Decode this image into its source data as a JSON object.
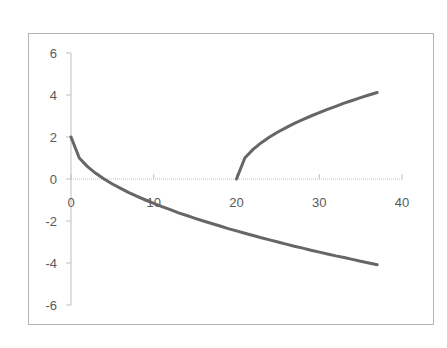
{
  "chart_data": {
    "type": "line",
    "title": "",
    "xlabel": "",
    "ylabel": "",
    "xlim": [
      0,
      40
    ],
    "ylim": [
      -6,
      6
    ],
    "x_ticks": [
      "0",
      "10",
      "20",
      "30",
      "40"
    ],
    "y_ticks": [
      "6",
      "4",
      "2",
      "0",
      "-2",
      "-4",
      "-6"
    ],
    "grid": false,
    "legend": null,
    "line_color": "#666666",
    "series": [
      {
        "name": "Series 1",
        "x": [
          0,
          1,
          2,
          3,
          4,
          5,
          6,
          7,
          8,
          9,
          10,
          11,
          12,
          13,
          14,
          15,
          16,
          17,
          18,
          19,
          20,
          21,
          22,
          23,
          24,
          25,
          26,
          27,
          28,
          29,
          30,
          31,
          32,
          33,
          34,
          35,
          36,
          37
        ],
        "values": [
          2.0,
          1.0,
          0.59,
          0.27,
          0.0,
          -0.24,
          -0.45,
          -0.65,
          -0.83,
          -1.0,
          -1.16,
          -1.32,
          -1.46,
          -1.61,
          -1.74,
          -1.87,
          -2.0,
          -2.12,
          -2.24,
          -2.36,
          -2.47,
          -2.58,
          -2.69,
          -2.8,
          -2.9,
          -3.0,
          -3.1,
          -3.2,
          -3.29,
          -3.39,
          -3.48,
          -3.57,
          -3.66,
          -3.74,
          -3.83,
          -3.92,
          -4.0,
          -4.08
        ]
      },
      {
        "name": "Series 2",
        "x": [
          20,
          21,
          22,
          23,
          24,
          25,
          26,
          27,
          28,
          29,
          30,
          31,
          32,
          33,
          34,
          35,
          36,
          37
        ],
        "values": [
          0.0,
          1.0,
          1.41,
          1.73,
          2.0,
          2.24,
          2.45,
          2.65,
          2.83,
          3.0,
          3.16,
          3.32,
          3.46,
          3.61,
          3.74,
          3.87,
          4.0,
          4.12
        ]
      }
    ]
  }
}
